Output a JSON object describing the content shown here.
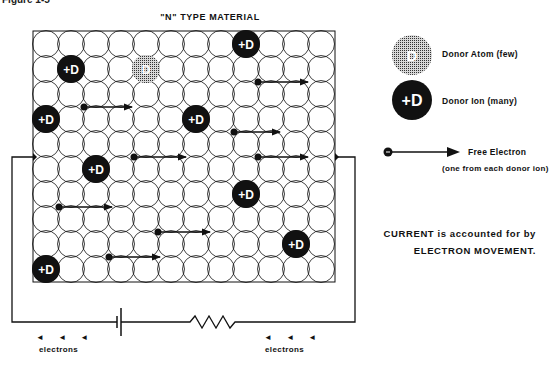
{
  "figure": {
    "label": "Figure 1-5",
    "title": "\"N\" TYPE MATERIAL"
  },
  "lattice": {
    "columns": 12,
    "rows": 10,
    "origin_x": 46,
    "origin_y": 44,
    "spacing": 25,
    "donor_ions": [
      {
        "col": 8,
        "row": 0,
        "label": "+D"
      },
      {
        "col": 1,
        "row": 1,
        "label": "+D"
      },
      {
        "col": 0,
        "row": 3,
        "label": "+D"
      },
      {
        "col": 6,
        "row": 3,
        "label": "+D"
      },
      {
        "col": 2,
        "row": 5,
        "label": "+D"
      },
      {
        "col": 8,
        "row": 6,
        "label": "+D"
      },
      {
        "col": 10,
        "row": 8,
        "label": "+D"
      },
      {
        "col": 0,
        "row": 9,
        "label": "+D"
      }
    ],
    "donor_atoms": [
      {
        "col": 4,
        "row": 1,
        "label": "D"
      }
    ],
    "free_electrons": [
      {
        "x": 258,
        "y": 82,
        "to_x": 308
      },
      {
        "x": 84,
        "y": 107,
        "to_x": 132
      },
      {
        "x": 234,
        "y": 132,
        "to_x": 280
      },
      {
        "x": 134,
        "y": 157,
        "to_x": 186
      },
      {
        "x": 258,
        "y": 157,
        "to_x": 308
      },
      {
        "x": 59,
        "y": 207,
        "to_x": 112
      },
      {
        "x": 158,
        "y": 232,
        "to_x": 210
      },
      {
        "x": 109,
        "y": 257,
        "to_x": 160
      }
    ]
  },
  "legend": {
    "donor_atom": {
      "symbol": "D",
      "label": "Donor Atom (few)"
    },
    "donor_ion": {
      "symbol": "+D",
      "label": "Donor Ion (many)"
    },
    "free_electron": {
      "label": "Free Electron",
      "sublabel": "(one from each donor ion)"
    }
  },
  "note": {
    "line1": "CURRENT is accounted for by",
    "line2": "ELECTRON MOVEMENT."
  },
  "circuit": {
    "components": [
      "battery",
      "resistor"
    ],
    "left_electrons_arrows": "◄ ◄ ◄",
    "left_electrons_label": "electrons",
    "right_electrons_arrows": "◄ ◄ ◄",
    "right_electrons_label": "electrons"
  },
  "colors": {
    "ink": "#111111",
    "donor_atom_fill": "#777777",
    "background": "#ffffff"
  }
}
